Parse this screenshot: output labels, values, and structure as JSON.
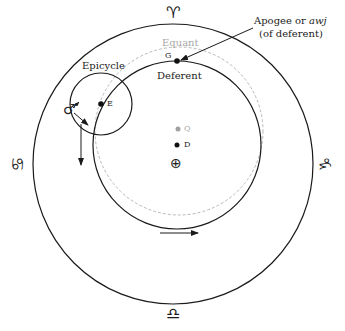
{
  "diagram": {
    "labels": {
      "apogee_line1_prefix": "Apogee or ",
      "apogee_line1_italic": "awj",
      "apogee_line2": "(of deferent)",
      "equant": "Equant",
      "deferent": "Deferent",
      "epicycle": "Epicycle",
      "point_g": "G",
      "point_e": "E",
      "point_q": "Q",
      "point_d": "D"
    },
    "symbols": {
      "earth": "⊕",
      "planet_mars": "♂",
      "aries_top": "♈",
      "cancer_left": "♋",
      "capricorn_right": "♑",
      "libra_bottom": "♎"
    },
    "colors": {
      "line": "#1a1a1a",
      "equant_dashed": "#b0b0b0",
      "equant_point": "#a0a0a0",
      "background": "#ffffff"
    },
    "geometry": {
      "outer_circle": {
        "cx": 173,
        "cy": 164,
        "r": 140
      },
      "deferent_circle": {
        "cx": 177,
        "cy": 145,
        "r": 84
      },
      "equant_circle": {
        "cx": 179,
        "cy": 131,
        "r": 84
      },
      "epicycle_circle": {
        "cx": 101,
        "cy": 104,
        "r": 31
      }
    }
  }
}
